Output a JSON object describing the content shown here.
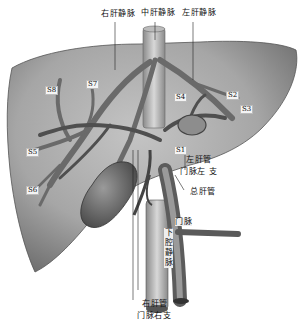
{
  "figure": {
    "colors": {
      "background": "#ffffff",
      "liver": "#a9a9a9",
      "vessel": "#7b7b7b",
      "vessel_dark": "#4a4a4a",
      "label": "#111111"
    }
  },
  "labels": {
    "right_hepatic_vein": "右肝静脉",
    "middle_hepatic_vein": "中肝静脉",
    "left_hepatic_vein": "左肝静脉",
    "left_hepatic_duct": "左肝管",
    "left_portal_branch": "门脉左 支",
    "common_hepatic_duct": "总肝管",
    "portal_vein": "门脉",
    "inferior_vena_cava": "下腔静脉",
    "right_hepatic_duct": "右肝管",
    "right_portal_branch": "门脉右支"
  },
  "segments": {
    "s8": "S8",
    "s7": "S7",
    "s4": "S4",
    "s2": "S2",
    "s3": "S3",
    "s5": "S5",
    "s6": "S6",
    "s1": "S1"
  }
}
